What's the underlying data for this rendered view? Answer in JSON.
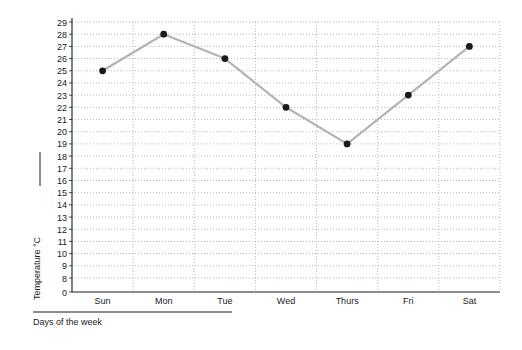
{
  "chart_data": {
    "type": "line",
    "title": "",
    "subtitle": "",
    "xlabel": "Days of the week",
    "ylabel": "Temperature  °C",
    "categories": [
      "Sun",
      "Mon",
      "Tue",
      "Wed",
      "Thurs",
      "Fri",
      "Sat"
    ],
    "x_tick_labels": [
      "Sun",
      "Mon",
      "Tue",
      "Wed",
      "Thurs",
      "Fri",
      "Sat"
    ],
    "y_tick_labels": [
      "0",
      "8",
      "9",
      "10",
      "11",
      "12",
      "13",
      "14",
      "15",
      "16",
      "17",
      "18",
      "19",
      "20",
      "21",
      "22",
      "23",
      "24",
      "25",
      "26",
      "27",
      "28",
      "29"
    ],
    "ylim": [
      8,
      29
    ],
    "y_axis_break": true,
    "grid": true,
    "grid_style": "dotted-horizontal",
    "legend": "none",
    "series": [
      {
        "name": "Temperature",
        "color": "#b3b3b3",
        "marker_color": "#1a1a1a",
        "points": [
          {
            "x": "Sun",
            "y": 25
          },
          {
            "x": "Mon",
            "y": 28
          },
          {
            "x": "Tue",
            "y": 26
          },
          {
            "x": "midweek",
            "y": 22
          },
          {
            "x": "Thurs",
            "y": 19
          },
          {
            "x": "Fri",
            "y": 23
          },
          {
            "x": "Sat",
            "y": 27
          }
        ],
        "values": [
          25,
          28,
          26,
          22,
          19,
          23,
          27
        ]
      }
    ]
  },
  "axes": {
    "y_title": "Temperature  °C",
    "x_title": "Days of the week"
  }
}
